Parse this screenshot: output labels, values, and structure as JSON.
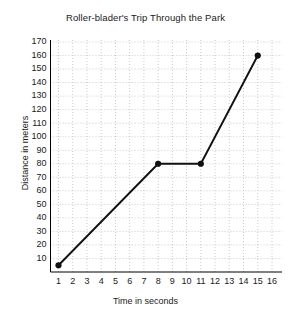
{
  "chart_data": {
    "type": "line",
    "title": "Roller-blader's Trip Through the Park",
    "xlabel": "Time in seconds",
    "ylabel": "Distance in meters",
    "xlim": [
      0,
      16.6
    ],
    "ylim": [
      0,
      174
    ],
    "grid": true,
    "grid_style": "dotted",
    "legend": "none",
    "xticks": [
      1,
      2,
      3,
      4,
      5,
      6,
      7,
      8,
      9,
      10,
      11,
      12,
      13,
      14,
      15,
      16
    ],
    "xtick_labels": [
      "1",
      "2",
      "3",
      "4",
      "5",
      "6",
      "7",
      "8",
      "9",
      "10",
      "11",
      "12",
      "13",
      "14",
      "15",
      "16"
    ],
    "yticks": [
      10,
      20,
      30,
      40,
      50,
      60,
      70,
      80,
      90,
      100,
      110,
      120,
      130,
      140,
      150,
      160,
      170
    ],
    "ytick_labels": [
      "10",
      "20",
      "30",
      "40",
      "50",
      "60",
      "70",
      "80",
      "90",
      "100",
      "110",
      "120",
      "130",
      "140",
      "150",
      "160",
      "170"
    ],
    "series": [
      {
        "name": "Roller-blader distance",
        "color": "#111111",
        "marker": "circle",
        "x": [
          1,
          8,
          11,
          15
        ],
        "y": [
          5,
          80,
          80,
          160
        ],
        "points": [
          {
            "x": 1,
            "y": 5
          },
          {
            "x": 8,
            "y": 80
          },
          {
            "x": 11,
            "y": 80
          },
          {
            "x": 15,
            "y": 160
          }
        ]
      }
    ]
  }
}
